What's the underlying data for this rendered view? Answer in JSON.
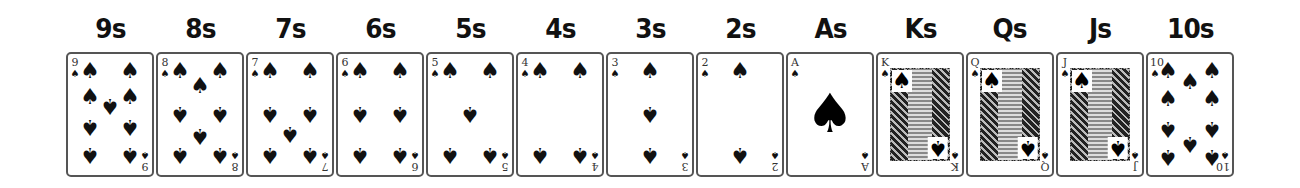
{
  "cards": [
    {
      "label": "9s",
      "rank": "9",
      "suit_icon": "♠",
      "kind": "pips",
      "pips": [
        [
          22,
          17,
          0
        ],
        [
          62,
          17,
          0
        ],
        [
          22,
          43,
          0
        ],
        [
          62,
          43,
          0
        ],
        [
          42,
          52,
          1
        ],
        [
          22,
          73,
          1
        ],
        [
          62,
          73,
          1
        ],
        [
          22,
          101,
          1
        ],
        [
          62,
          101,
          1
        ]
      ]
    },
    {
      "label": "8s",
      "rank": "8",
      "suit_icon": "♠",
      "kind": "pips",
      "pips": [
        [
          22,
          17,
          0
        ],
        [
          62,
          17,
          0
        ],
        [
          42,
          32,
          0
        ],
        [
          22,
          60,
          1
        ],
        [
          62,
          60,
          1
        ],
        [
          42,
          82,
          1
        ],
        [
          22,
          101,
          1
        ],
        [
          62,
          101,
          1
        ]
      ]
    },
    {
      "label": "7s",
      "rank": "7",
      "suit_icon": "♠",
      "kind": "pips",
      "pips": [
        [
          22,
          17,
          0
        ],
        [
          62,
          17,
          0
        ],
        [
          22,
          60,
          1
        ],
        [
          62,
          60,
          1
        ],
        [
          42,
          80,
          1
        ],
        [
          22,
          101,
          1
        ],
        [
          62,
          101,
          1
        ]
      ]
    },
    {
      "label": "6s",
      "rank": "6",
      "suit_icon": "♠",
      "kind": "pips",
      "pips": [
        [
          22,
          17,
          0
        ],
        [
          62,
          17,
          0
        ],
        [
          22,
          60,
          1
        ],
        [
          62,
          60,
          1
        ],
        [
          22,
          101,
          1
        ],
        [
          62,
          101,
          1
        ]
      ]
    },
    {
      "label": "5s",
      "rank": "5",
      "suit_icon": "♠",
      "kind": "pips",
      "pips": [
        [
          22,
          17,
          0
        ],
        [
          62,
          17,
          0
        ],
        [
          42,
          60,
          1
        ],
        [
          22,
          101,
          1
        ],
        [
          62,
          101,
          1
        ]
      ]
    },
    {
      "label": "4s",
      "rank": "4",
      "suit_icon": "♠",
      "kind": "pips",
      "pips": [
        [
          22,
          17,
          0
        ],
        [
          62,
          17,
          0
        ],
        [
          22,
          101,
          1
        ],
        [
          62,
          101,
          1
        ]
      ]
    },
    {
      "label": "3s",
      "rank": "3",
      "suit_icon": "♠",
      "kind": "pips",
      "pips": [
        [
          42,
          17,
          0
        ],
        [
          42,
          60,
          1
        ],
        [
          42,
          101,
          1
        ]
      ]
    },
    {
      "label": "2s",
      "rank": "2",
      "suit_icon": "♠",
      "kind": "pips",
      "pips": [
        [
          42,
          17,
          0
        ],
        [
          42,
          101,
          1
        ]
      ]
    },
    {
      "label": "As",
      "rank": "A",
      "suit_icon": "♠",
      "kind": "ace",
      "pips": []
    },
    {
      "label": "Ks",
      "rank": "K",
      "suit_icon": "♠",
      "kind": "face",
      "pips": []
    },
    {
      "label": "Qs",
      "rank": "Q",
      "suit_icon": "♠",
      "kind": "face",
      "pips": []
    },
    {
      "label": "Js",
      "rank": "J",
      "suit_icon": "♠",
      "kind": "face",
      "pips": []
    },
    {
      "label": "10s",
      "rank": "10",
      "suit_icon": "♠",
      "kind": "pips",
      "pips": [
        [
          20,
          17,
          0
        ],
        [
          64,
          17,
          0
        ],
        [
          42,
          28,
          0
        ],
        [
          20,
          45,
          0
        ],
        [
          64,
          45,
          0
        ],
        [
          20,
          75,
          1
        ],
        [
          64,
          75,
          1
        ],
        [
          42,
          90,
          1
        ],
        [
          20,
          103,
          1
        ],
        [
          64,
          103,
          1
        ]
      ]
    }
  ]
}
